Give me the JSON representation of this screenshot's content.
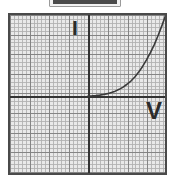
{
  "figure": {
    "kind": "iv-characteristic-graph",
    "background_color": "#e9e9e9",
    "frame_color": "#4a4a4a",
    "axis_color": "#333333",
    "grid_minor_color": "#b0b0b0",
    "grid_major_color": "#828282",
    "curve_color": "#3a3a3a"
  },
  "top_clip": {
    "name": "cropped-bar",
    "border_color": "#9a9a9a",
    "fill_color": "#4a4a4a",
    "label": ""
  },
  "labels": {
    "current_axis": "I",
    "voltage_axis": "V"
  },
  "chart_data": {
    "type": "line",
    "title": "",
    "xlabel": "V",
    "ylabel": "I",
    "grid": true,
    "legend": null,
    "xlim": [
      -20,
      20
    ],
    "ylim": [
      -20,
      20
    ],
    "axis_origin_px": [
      78,
      81
    ],
    "series": [
      {
        "name": "diode-forward-characteristic",
        "x": [
          0.0,
          1.0,
          2.0,
          3.0,
          4.0,
          5.0,
          6.0,
          7.0,
          8.0,
          9.0,
          10.0,
          11.0,
          12.0,
          13.0,
          14.0,
          15.0,
          16.0,
          17.0,
          18.0,
          19.0,
          20.0
        ],
        "y": [
          0.0,
          0.05,
          0.12,
          0.22,
          0.37,
          0.58,
          0.85,
          1.2,
          1.65,
          2.2,
          2.9,
          3.7,
          4.7,
          5.9,
          7.3,
          8.9,
          10.7,
          12.7,
          15.0,
          17.5,
          20.2
        ]
      }
    ],
    "annotations": [
      {
        "text": "I",
        "position": "upper-left-of-y-axis"
      },
      {
        "text": "V",
        "position": "right-of-x-axis"
      }
    ]
  }
}
